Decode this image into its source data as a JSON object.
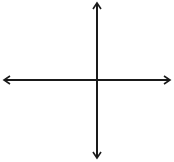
{
  "chart_data": {
    "type": "line",
    "title": "",
    "function_label": "f(x)",
    "xlabel": "x",
    "ylabel": "y",
    "xlim": [
      -6,
      5
    ],
    "ylim": [
      -5,
      5
    ],
    "grid": true,
    "x_ticks": [
      -4,
      -2,
      0,
      2,
      4
    ],
    "y_ticks": [
      4,
      2,
      -2,
      -4
    ],
    "x_tick_labels": [
      "-4",
      "-2",
      "0",
      "2",
      "4"
    ],
    "y_tick_labels": [
      "4",
      "2",
      "-2",
      "-4"
    ],
    "series": [
      {
        "name": "f(x)",
        "points": [
          [
            -3,
            -3
          ],
          [
            1,
            -3
          ],
          [
            4,
            3
          ]
        ],
        "endpoints": [
          {
            "x": -3,
            "y": -3,
            "filled": true
          },
          {
            "x": 1,
            "y": -3,
            "filled": true
          },
          {
            "x": 4,
            "y": 3,
            "filled": true
          }
        ]
      }
    ],
    "colors": {
      "grid": "#c8c8c8",
      "axis": "#1a1a1a",
      "line": "#1a1a1a",
      "label": "#555555"
    }
  }
}
